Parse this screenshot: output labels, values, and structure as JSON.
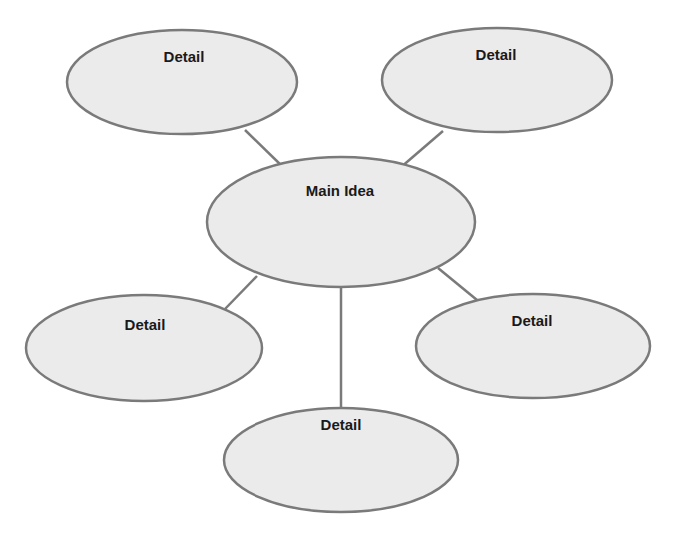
{
  "diagram": {
    "type": "concept-web",
    "colors": {
      "node_fill": "#ebebeb",
      "node_stroke": "#7a7a7a",
      "edge": "#7a7a7a",
      "text": "#1a1a1a",
      "background": "#ffffff"
    },
    "center": {
      "label": "Main Idea"
    },
    "details": [
      {
        "id": "top-left",
        "label": "Detail"
      },
      {
        "id": "top-right",
        "label": "Detail"
      },
      {
        "id": "middle-left",
        "label": "Detail"
      },
      {
        "id": "middle-right",
        "label": "Detail"
      },
      {
        "id": "bottom",
        "label": "Detail"
      }
    ]
  }
}
